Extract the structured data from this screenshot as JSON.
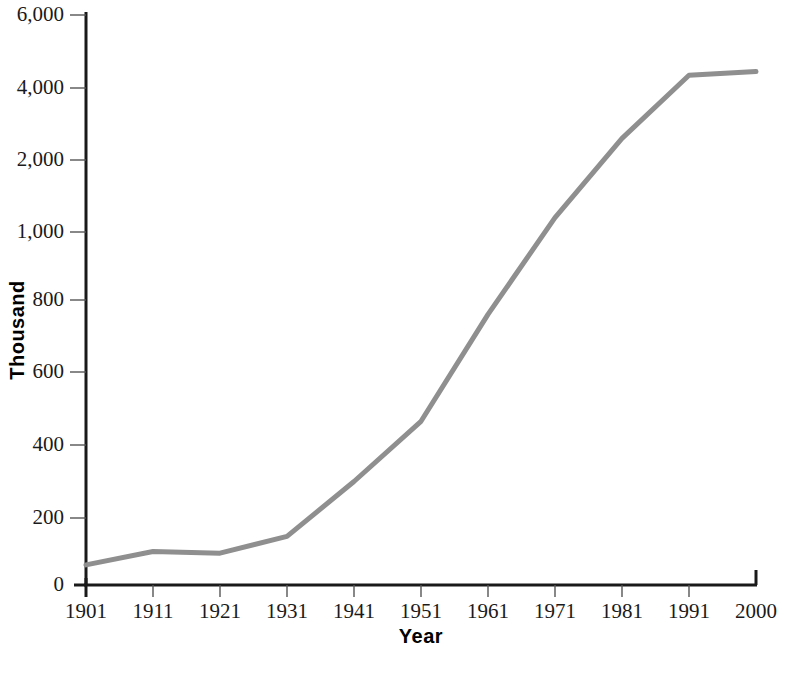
{
  "chart_data": {
    "type": "line",
    "title": "",
    "xlabel": "Year",
    "ylabel": "Thousand",
    "x": [
      1901,
      1911,
      1921,
      1931,
      1941,
      1951,
      1961,
      1971,
      1981,
      1991,
      2000
    ],
    "values": [
      60,
      100,
      95,
      145,
      300,
      465,
      760,
      1200,
      2600,
      4350,
      4450
    ],
    "series": [
      {
        "name": "Population",
        "values": [
          60,
          100,
          95,
          145,
          300,
          465,
          760,
          1200,
          2600,
          4350,
          4450
        ]
      }
    ],
    "xtick_labels": [
      "1901",
      "1911",
      "1921",
      "1931",
      "1941",
      "1951",
      "1961",
      "1971",
      "1981",
      "1991",
      "2000"
    ],
    "ytick_labels": [
      "0",
      "200",
      "400",
      "600",
      "800",
      "1,000",
      "2,000",
      "4,000",
      "6,000"
    ],
    "ytick_values": [
      0,
      200,
      400,
      600,
      800,
      1000,
      2000,
      4000,
      6000
    ],
    "yscale": "piecewise-linear-log",
    "xlim": [
      1901,
      2000
    ],
    "ylim": [
      0,
      6000
    ],
    "grid": false,
    "legend": "none",
    "line_color": "#8f8f8f",
    "axis_color": "#1a1a1a",
    "background_color": "#ffffff"
  },
  "axis_titles": {
    "x": "Year",
    "y": "Thousand"
  }
}
